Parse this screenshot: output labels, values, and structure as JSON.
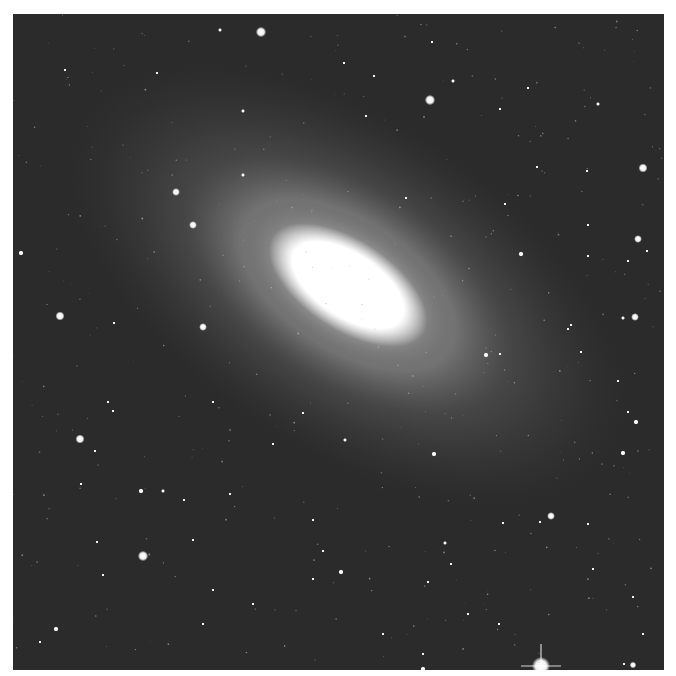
{
  "image": {
    "subject": "elliptical/lenticular galaxy with foreground stars",
    "caption": "",
    "background_color": "#2b2b2b",
    "galaxy": {
      "cx": 335,
      "cy": 271,
      "core_rx": 82,
      "core_ry": 40,
      "angle_deg": 33
    },
    "stars": [
      [
        248,
        18,
        4
      ],
      [
        207,
        16,
        1.5
      ],
      [
        419,
        28,
        1
      ],
      [
        52,
        56,
        1
      ],
      [
        144,
        59,
        1
      ],
      [
        331,
        49,
        1
      ],
      [
        361,
        62,
        1
      ],
      [
        440,
        67,
        1.5
      ],
      [
        515,
        74,
        1
      ],
      [
        417,
        86,
        4
      ],
      [
        585,
        90,
        1.5
      ],
      [
        230,
        97,
        1.5
      ],
      [
        353,
        102,
        1
      ],
      [
        487,
        95,
        1
      ],
      [
        630,
        154,
        3.5
      ],
      [
        574,
        157,
        1
      ],
      [
        524,
        153,
        1
      ],
      [
        163,
        178,
        3
      ],
      [
        230,
        161,
        1.5
      ],
      [
        393,
        184,
        1
      ],
      [
        492,
        190,
        1
      ],
      [
        575,
        211,
        1
      ],
      [
        180,
        211,
        3
      ],
      [
        625,
        225,
        3
      ],
      [
        634,
        237,
        1
      ],
      [
        508,
        240,
        2
      ],
      [
        575,
        242,
        1
      ],
      [
        615,
        247,
        1
      ],
      [
        8,
        239,
        2
      ],
      [
        47,
        302,
        3.5
      ],
      [
        101,
        309,
        1
      ],
      [
        190,
        313,
        3
      ],
      [
        622,
        303,
        3
      ],
      [
        610,
        304,
        1.5
      ],
      [
        558,
        311,
        1
      ],
      [
        555,
        315,
        1
      ],
      [
        568,
        338,
        1
      ],
      [
        487,
        340,
        1
      ],
      [
        473,
        341,
        2
      ],
      [
        605,
        367,
        1
      ],
      [
        615,
        398,
        1
      ],
      [
        623,
        408,
        2
      ],
      [
        67,
        425,
        3.5
      ],
      [
        95,
        388,
        1
      ],
      [
        100,
        397,
        1
      ],
      [
        82,
        437,
        1
      ],
      [
        68,
        470,
        1
      ],
      [
        128,
        477,
        2
      ],
      [
        150,
        477,
        1.5
      ],
      [
        171,
        486,
        1
      ],
      [
        421,
        440,
        2
      ],
      [
        332,
        426,
        1.5
      ],
      [
        300,
        506,
        1
      ],
      [
        217,
        480,
        1
      ],
      [
        290,
        399,
        1
      ],
      [
        200,
        388,
        1
      ],
      [
        260,
        430,
        1
      ],
      [
        180,
        526,
        1
      ],
      [
        538,
        502,
        3
      ],
      [
        527,
        508,
        1
      ],
      [
        490,
        509,
        1
      ],
      [
        432,
        529,
        1.5
      ],
      [
        610,
        439,
        2
      ],
      [
        130,
        542,
        4
      ],
      [
        84,
        528,
        1
      ],
      [
        90,
        561,
        1
      ],
      [
        43,
        615,
        2
      ],
      [
        310,
        537,
        1
      ],
      [
        300,
        565,
        1
      ],
      [
        328,
        558,
        2
      ],
      [
        415,
        568,
        1
      ],
      [
        438,
        550,
        1
      ],
      [
        575,
        510,
        1
      ],
      [
        580,
        555,
        1
      ],
      [
        620,
        583,
        1
      ],
      [
        486,
        610,
        1
      ],
      [
        528,
        652,
        7
      ],
      [
        611,
        650,
        1
      ],
      [
        620,
        651,
        2.5
      ],
      [
        200,
        576,
        1
      ],
      [
        190,
        610,
        1
      ],
      [
        240,
        590,
        1
      ],
      [
        370,
        620,
        1
      ],
      [
        410,
        640,
        1
      ],
      [
        455,
        600,
        1
      ],
      [
        630,
        620,
        1
      ],
      [
        27,
        628,
        1
      ],
      [
        410,
        655,
        2
      ],
      [
        60,
        660,
        1
      ]
    ]
  }
}
